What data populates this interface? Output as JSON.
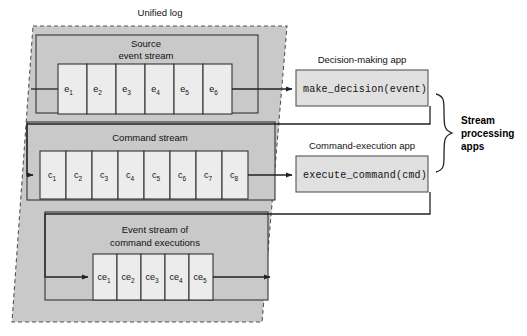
{
  "diagram": {
    "title": "Unified log",
    "unified_log_label": "Unified log",
    "streams": [
      {
        "id": "source-event-stream",
        "label_line1": "Source",
        "label_line2": "event stream",
        "prefix": "e",
        "cells": [
          "e1",
          "e2",
          "e3",
          "e4",
          "e5",
          "e6"
        ],
        "cell_bases": [
          "e",
          "e",
          "e",
          "e",
          "e",
          "e"
        ],
        "cell_subs": [
          "1",
          "2",
          "3",
          "4",
          "5",
          "6"
        ]
      },
      {
        "id": "command-stream",
        "label_line1": "Command stream",
        "label_line2": "",
        "prefix": "c",
        "cells": [
          "c1",
          "c2",
          "c3",
          "c4",
          "c5",
          "c6",
          "c7",
          "c8"
        ],
        "cell_bases": [
          "c",
          "c",
          "c",
          "c",
          "c",
          "c",
          "c",
          "c"
        ],
        "cell_subs": [
          "1",
          "2",
          "3",
          "4",
          "5",
          "6",
          "7",
          "8"
        ]
      },
      {
        "id": "command-execution-event-stream",
        "label_line1": "Event stream of",
        "label_line2": "command executions",
        "prefix": "ce",
        "cells": [
          "ce1",
          "ce2",
          "ce3",
          "ce4",
          "ce5"
        ],
        "cell_bases": [
          "ce",
          "ce",
          "ce",
          "ce",
          "ce"
        ],
        "cell_subs": [
          "1",
          "2",
          "3",
          "4",
          "5"
        ]
      }
    ],
    "apps": [
      {
        "id": "decision-making-app",
        "title": "Decision-making app",
        "code": "make_decision(event)"
      },
      {
        "id": "command-execution-app",
        "title": "Command-execution app",
        "code": "execute_command(cmd)"
      }
    ],
    "brace_label": {
      "line1": "Stream",
      "line2": "processing",
      "line3": "apps"
    },
    "colors": {
      "unified_log_fill": "#c9c9c9",
      "unified_log_stroke": "#555555",
      "stream_band_fill": "#c9c9c9",
      "stream_band_stroke": "#333333",
      "cell_fill": "#ececec",
      "cell_stroke": "#333333",
      "app_fill": "#e0e0e0",
      "app_stroke": "#555555",
      "line": "#222222",
      "text": "#111111"
    }
  }
}
